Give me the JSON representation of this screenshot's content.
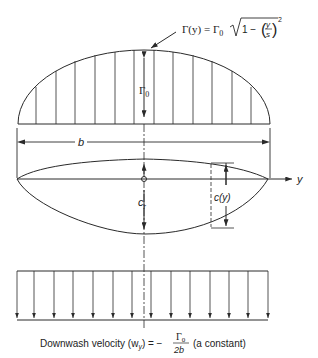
{
  "figure": {
    "circulation_formula": {
      "lhs": "Γ(y) = Γ",
      "lhs_sub": "0",
      "rad_prefix": "1 −",
      "frac_num": "y",
      "frac_den": "s",
      "exponent": "2"
    },
    "gamma0_label": "Γ",
    "gamma0_sub": "0",
    "span_label": "b",
    "axis_label": "y",
    "root_chord_label": "c",
    "root_chord_sub": "r",
    "local_chord_label": "c(y)",
    "downwash": {
      "prefix": "Downwash velocity (w",
      "prefix_sub": "y",
      "mid": ") = −",
      "frac_num": "Γ",
      "frac_num_sub": "0",
      "frac_den": "2b",
      "suffix": "(a constant)"
    }
  },
  "colors": {
    "line": "#2a2a2a",
    "background": "#ffffff"
  }
}
